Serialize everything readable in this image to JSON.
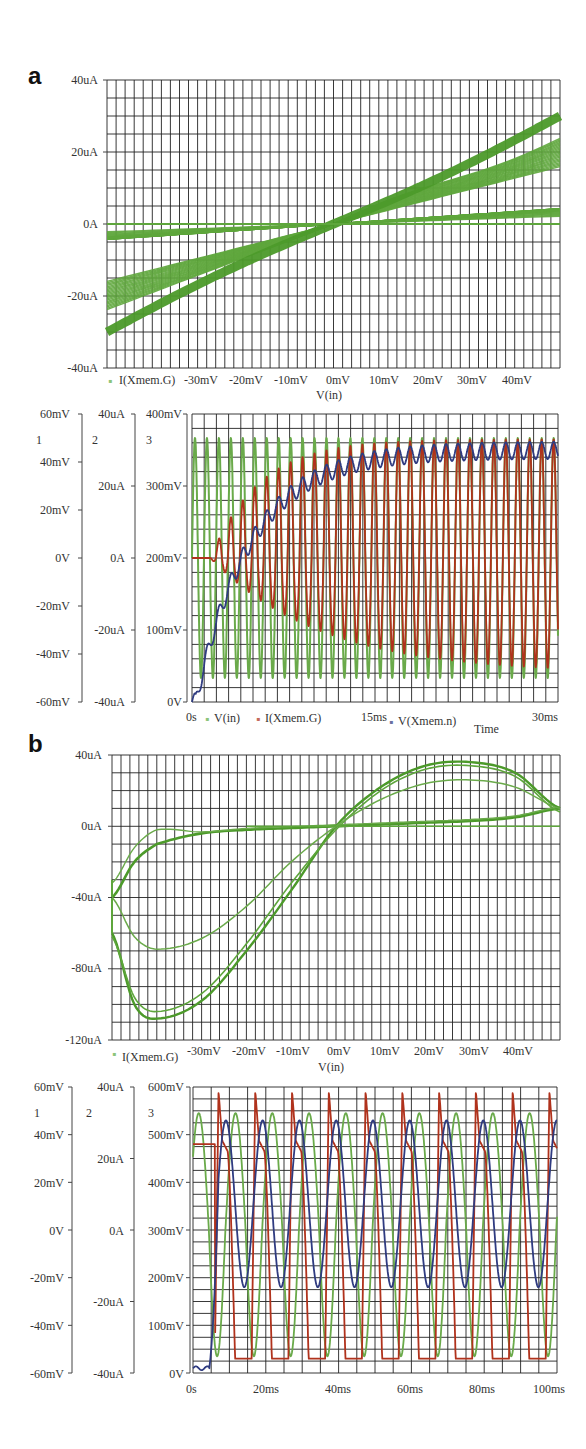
{
  "panels": {
    "a": {
      "letter": "a"
    },
    "b": {
      "letter": "b"
    }
  },
  "chart_data": [
    {
      "id": "a-iv",
      "type": "line",
      "title": "",
      "xlabel": "V(in)",
      "ylabel": "",
      "legend": [
        "I(Xmem.G)"
      ],
      "x_ticks": [
        "-30mV",
        "-20mV",
        "-10mV",
        "0mV",
        "10mV",
        "20mV",
        "30mV",
        "40mV"
      ],
      "y_ticks": [
        "40uA",
        "20uA",
        "0A",
        "-20uA",
        "-40uA"
      ],
      "xlim": [
        -50,
        50
      ],
      "ylim": [
        -40,
        40
      ],
      "grid": true,
      "description": "Family of pinched hysteresis loops; all pass through origin; current ranges approx -31uA at -50mV to +29uA at +50mV",
      "series": [
        {
          "name": "I(Xmem.G)",
          "color": "#4c9a2a",
          "x": [
            -50,
            -40,
            -30,
            -20,
            -10,
            0,
            10,
            20,
            30,
            40,
            50
          ],
          "y_upper": [
            0,
            0,
            0,
            0,
            0,
            0,
            6,
            12,
            18,
            24,
            29
          ],
          "y_lower": [
            -31,
            -26,
            -20,
            -13,
            -6,
            0,
            0,
            0,
            0,
            0,
            0
          ]
        }
      ]
    },
    {
      "id": "a-time",
      "type": "line",
      "title": "",
      "xlabel": "Time",
      "x_ticks": [
        "0s",
        "15ms",
        "30ms"
      ],
      "xlim": [
        0,
        30
      ],
      "axes": [
        {
          "id": "1",
          "ticks": [
            "60mV",
            "40mV",
            "20mV",
            "0V",
            "-20mV",
            "-40mV",
            "-60mV"
          ],
          "range": [
            -60,
            60
          ],
          "unit": "mV"
        },
        {
          "id": "2",
          "ticks": [
            "40uA",
            "20uA",
            "0A",
            "-20uA",
            "-40uA"
          ],
          "range": [
            -40,
            40
          ],
          "unit": "uA"
        },
        {
          "id": "3",
          "ticks": [
            "400mV",
            "300mV",
            "200mV",
            "100mV",
            "0V"
          ],
          "range": [
            0,
            400
          ],
          "unit": "mV"
        }
      ],
      "legend": [
        "V(in)",
        "I(Xmem.G)",
        "V(Xmem.n)"
      ],
      "grid": true,
      "series": [
        {
          "name": "V(in)",
          "axis": "1",
          "color": "#6aaa4a",
          "description": "sinusoid, amplitude ~50mV, ~1ms period (30 cycles)",
          "amplitude": 50,
          "cycles": 30
        },
        {
          "name": "I(Xmem.G)",
          "axis": "2",
          "color": "#b03a1e",
          "description": "starts at 0, grows to oscillation with amplitude ~ +33uA / -32uA",
          "final_max": 33,
          "final_min": -32
        },
        {
          "name": "V(Xmem.n)",
          "axis": "3",
          "color": "#2e3a7a",
          "description": "rises from 0V, saturates ~345-370mV with ripple",
          "x": [
            0,
            1,
            2,
            4,
            6,
            8,
            10,
            15,
            20,
            30
          ],
          "y": [
            0,
            70,
            150,
            230,
            270,
            300,
            320,
            340,
            350,
            355
          ]
        }
      ]
    },
    {
      "id": "b-iv",
      "type": "line",
      "title": "",
      "xlabel": "V(in)",
      "legend": [
        "I(Xmem.G)"
      ],
      "x_ticks": [
        "-30mV",
        "-20mV",
        "-10mV",
        "0mV",
        "10mV",
        "20mV",
        "30mV",
        "40mV"
      ],
      "y_ticks": [
        "40uA",
        "0uA",
        "-40uA",
        "-80uA",
        "-120uA"
      ],
      "xlim": [
        -50,
        50
      ],
      "ylim": [
        -120,
        40
      ],
      "grid": true,
      "series": [
        {
          "name": "I(Xmem.G) loop upper",
          "color": "#4c9a2a",
          "x": [
            -50,
            -45,
            -40,
            -30,
            -20,
            -10,
            0,
            10,
            20,
            30,
            40,
            50
          ],
          "y": [
            -40,
            -20,
            -10,
            -4,
            -2,
            -1,
            0,
            1,
            2,
            3,
            5,
            10
          ]
        },
        {
          "name": "I(Xmem.G) loop lower",
          "color": "#4c9a2a",
          "x": [
            -50,
            -45,
            -40,
            -30,
            -20,
            -10,
            0,
            10,
            20,
            30,
            40,
            50
          ],
          "y": [
            -60,
            -100,
            -108,
            -98,
            -70,
            -36,
            0,
            22,
            34,
            36,
            30,
            10
          ]
        },
        {
          "name": "I(Xmem.G) inner loop",
          "color": "#4c9a2a",
          "x": [
            -50,
            -45,
            -40,
            -30,
            -20,
            -10,
            0,
            10,
            20,
            30,
            40,
            50
          ],
          "y": [
            -40,
            -62,
            -69,
            -63,
            -45,
            -20,
            0,
            15,
            24,
            26,
            22,
            10
          ]
        }
      ]
    },
    {
      "id": "b-time",
      "type": "line",
      "xlabel": "",
      "x_ticks": [
        "0s",
        "20ms",
        "40ms",
        "60ms",
        "80ms",
        "100ms"
      ],
      "xlim": [
        0,
        100
      ],
      "axes": [
        {
          "id": "1",
          "ticks": [
            "60mV",
            "40mV",
            "20mV",
            "0V",
            "-20mV",
            "-40mV",
            "-60mV"
          ],
          "range": [
            -60,
            60
          ],
          "unit": "mV"
        },
        {
          "id": "2",
          "ticks": [
            "40uA",
            "20uA",
            "0A",
            "-20uA",
            "-40uA"
          ],
          "range": [
            -40,
            40
          ],
          "unit": "uA"
        },
        {
          "id": "3",
          "ticks": [
            "600mV",
            "500mV",
            "400mV",
            "300mV",
            "200mV",
            "100mV",
            "0V"
          ],
          "range": [
            0,
            600
          ],
          "unit": "mV"
        }
      ],
      "grid": true,
      "series": [
        {
          "name": "V(in)",
          "axis": "1",
          "color": "#6aaa4a",
          "description": "periodic ~10ms, peaks ~+49mV, troughs ~-53mV",
          "peak": 49,
          "trough": -53,
          "period_ms": 10
        },
        {
          "name": "I(Xmem.G)",
          "axis": "2",
          "color": "#b83020",
          "description": "flat ~24uA to 6ms, then periodic spikes peak ~+39uA trough ~-36uA",
          "peak": 39,
          "trough": -36
        },
        {
          "name": "V(Xmem.n)",
          "axis": "3",
          "color": "#34408a",
          "description": "~10mV until 5ms, then oscillates ~175mV to ~530mV",
          "peak": 530,
          "trough": 180
        }
      ]
    }
  ],
  "labels": {
    "a_iv": {
      "y": [
        "40uA",
        "20uA",
        "0A",
        "-20uA",
        "-40uA"
      ],
      "x": [
        "-30mV",
        "-20mV",
        "-10mV",
        "0mV",
        "10mV",
        "20mV",
        "30mV",
        "40mV"
      ],
      "legend": "I(Xmem.G)",
      "xlabel": "V(in)"
    },
    "a_time": {
      "axis1": [
        "60mV",
        "40mV",
        "20mV",
        "0V",
        "-20mV",
        "-40mV",
        "-60mV"
      ],
      "axis2": [
        "40uA",
        "20uA",
        "0A",
        "-20uA",
        "-40uA"
      ],
      "axis3": [
        "400mV",
        "300mV",
        "200mV",
        "100mV",
        "0V"
      ],
      "axis_ids": [
        "1",
        "2",
        "3"
      ],
      "x": [
        "0s",
        "15ms",
        "30ms"
      ],
      "legend": [
        "V(in)",
        "I(Xmem.G)",
        "V(Xmem.n)"
      ],
      "xlabel": "Time"
    },
    "b_iv": {
      "y": [
        "40uA",
        "0uA",
        "-40uA",
        "-80uA",
        "-120uA"
      ],
      "x": [
        "-30mV",
        "-20mV",
        "-10mV",
        "0mV",
        "10mV",
        "20mV",
        "30mV",
        "40mV"
      ],
      "legend": "I(Xmem.G)",
      "xlabel": "V(in)"
    },
    "b_time": {
      "axis1": [
        "60mV",
        "40mV",
        "20mV",
        "0V",
        "-20mV",
        "-40mV",
        "-60mV"
      ],
      "axis2": [
        "40uA",
        "20uA",
        "0A",
        "-20uA",
        "-40uA"
      ],
      "axis3": [
        "600mV",
        "500mV",
        "400mV",
        "300mV",
        "200mV",
        "100mV",
        "0V"
      ],
      "axis_ids": [
        "1",
        "2",
        "3"
      ],
      "x": [
        "0s",
        "20ms",
        "40ms",
        "60ms",
        "80ms",
        "100ms"
      ]
    }
  },
  "colors": {
    "green": "#5ea63c",
    "red": "#b0321c",
    "blue": "#2f3b80",
    "grid": "#222222"
  }
}
